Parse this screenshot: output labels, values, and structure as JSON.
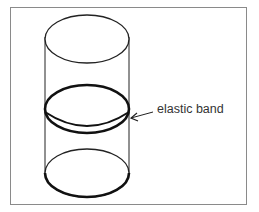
{
  "diagram": {
    "annotations": [
      {
        "label": "elastic band",
        "target": "middle-ring"
      }
    ]
  }
}
